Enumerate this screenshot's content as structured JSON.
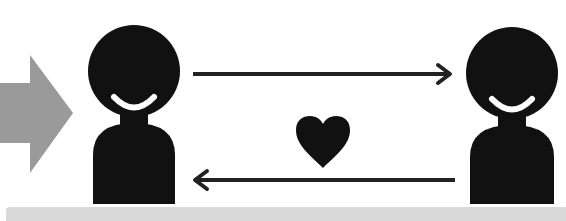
{
  "diagram": {
    "colors": {
      "figure": "#111111",
      "incoming_arrow": "#9a9a9a",
      "connector_arrows": "#222222",
      "heart": "#111111",
      "bottom_bar": "#d9d9d9",
      "background": "#ffffff"
    },
    "elements": [
      {
        "id": "incoming-arrow",
        "icon": "block-arrow-right",
        "color": "#9a9a9a"
      },
      {
        "id": "person-left",
        "icon": "smiling-person"
      },
      {
        "id": "arrow-left-to-right",
        "icon": "arrow-right"
      },
      {
        "id": "heart",
        "icon": "heart"
      },
      {
        "id": "arrow-right-to-left",
        "icon": "arrow-left"
      },
      {
        "id": "person-right",
        "icon": "smiling-person"
      }
    ]
  }
}
